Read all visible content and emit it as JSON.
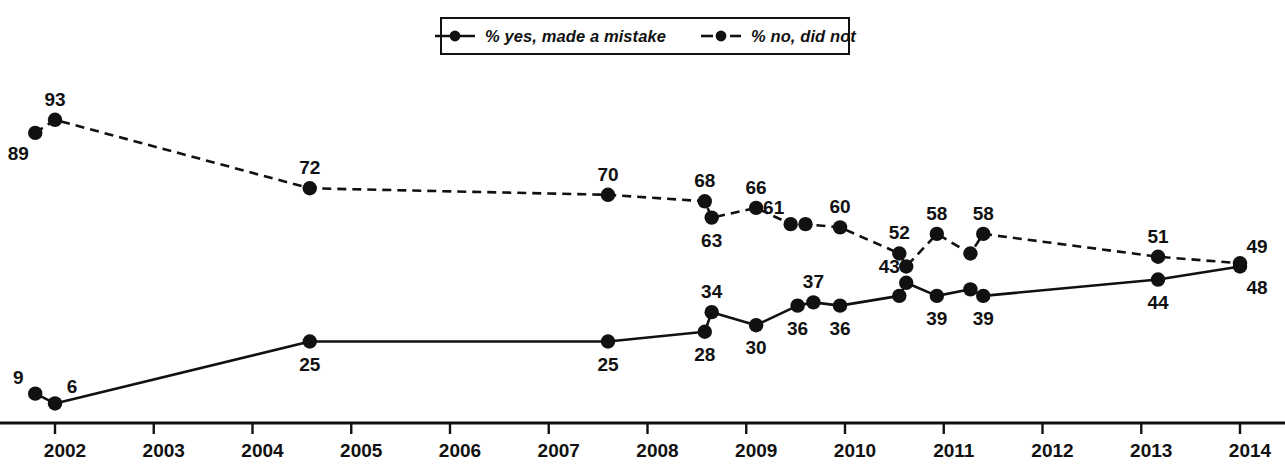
{
  "chart_data": {
    "type": "line",
    "title": "",
    "subtitle": "",
    "xlabel": "",
    "ylabel": "",
    "grid": false,
    "legend_position": "top-center",
    "xlim": [
      2001.6,
      2014.15
    ],
    "ylim": [
      0,
      100
    ],
    "x_tick_labels": [
      "2002",
      "2003",
      "2004",
      "2005",
      "2006",
      "2007",
      "2008",
      "2009",
      "2010",
      "2011",
      "2012",
      "2013",
      "2014"
    ],
    "x_ticks": [
      2002,
      2003,
      2004,
      2005,
      2006,
      2007,
      2008,
      2009,
      2010,
      2011,
      2012,
      2013,
      2014
    ],
    "series": [
      {
        "name": "% yes, made a mistake",
        "style": "solid",
        "marker": "circle",
        "color": "#111111",
        "points": [
          {
            "x": 2001.8,
            "y": 9,
            "label": "9",
            "label_pos": "above-left"
          },
          {
            "x": 2002.0,
            "y": 6,
            "label": "6",
            "label_pos": "above-right"
          },
          {
            "x": 2004.58,
            "y": 25,
            "label": "25",
            "label_pos": "below"
          },
          {
            "x": 2007.6,
            "y": 25,
            "label": "25",
            "label_pos": "below"
          },
          {
            "x": 2008.58,
            "y": 28,
            "label": "28",
            "label_pos": "below"
          },
          {
            "x": 2008.65,
            "y": 34,
            "label": "34",
            "label_pos": "above"
          },
          {
            "x": 2009.1,
            "y": 30,
            "label": "30",
            "label_pos": "below"
          },
          {
            "x": 2009.52,
            "y": 36,
            "label": "36",
            "label_pos": "below"
          },
          {
            "x": 2009.68,
            "y": 37,
            "label": "37",
            "label_pos": "above"
          },
          {
            "x": 2009.95,
            "y": 36,
            "label": "36",
            "label_pos": "below"
          },
          {
            "x": 2010.55,
            "y": 39,
            "label": "",
            "label_pos": "none"
          },
          {
            "x": 2010.62,
            "y": 43,
            "label": "43",
            "label_pos": "above-left"
          },
          {
            "x": 2010.93,
            "y": 39,
            "label": "39",
            "label_pos": "below"
          },
          {
            "x": 2011.27,
            "y": 41,
            "label": "",
            "label_pos": "none"
          },
          {
            "x": 2011.4,
            "y": 39,
            "label": "39",
            "label_pos": "below"
          },
          {
            "x": 2013.17,
            "y": 44,
            "label": "44",
            "label_pos": "below"
          },
          {
            "x": 2014.0,
            "y": 48,
            "label": "48",
            "label_pos": "below-right"
          }
        ]
      },
      {
        "name": "% no, did not",
        "style": "dashed",
        "marker": "circle",
        "color": "#111111",
        "points": [
          {
            "x": 2001.8,
            "y": 89,
            "label": "89",
            "label_pos": "below-left"
          },
          {
            "x": 2002.0,
            "y": 93,
            "label": "93",
            "label_pos": "above"
          },
          {
            "x": 2004.58,
            "y": 72,
            "label": "72",
            "label_pos": "above"
          },
          {
            "x": 2007.6,
            "y": 70,
            "label": "70",
            "label_pos": "above"
          },
          {
            "x": 2008.58,
            "y": 68,
            "label": "68",
            "label_pos": "above"
          },
          {
            "x": 2008.65,
            "y": 63,
            "label": "63",
            "label_pos": "below"
          },
          {
            "x": 2009.1,
            "y": 66,
            "label": "66",
            "label_pos": "above"
          },
          {
            "x": 2009.45,
            "y": 61,
            "label": "61",
            "label_pos": "above-left"
          },
          {
            "x": 2009.6,
            "y": 61,
            "label": "",
            "label_pos": "none"
          },
          {
            "x": 2009.95,
            "y": 60,
            "label": "60",
            "label_pos": "above"
          },
          {
            "x": 2010.55,
            "y": 52,
            "label": "52",
            "label_pos": "above"
          },
          {
            "x": 2010.62,
            "y": 48,
            "label": "",
            "label_pos": "none"
          },
          {
            "x": 2010.93,
            "y": 58,
            "label": "58",
            "label_pos": "above"
          },
          {
            "x": 2011.27,
            "y": 52,
            "label": "",
            "label_pos": "none"
          },
          {
            "x": 2011.4,
            "y": 58,
            "label": "58",
            "label_pos": "above"
          },
          {
            "x": 2013.17,
            "y": 51,
            "label": "51",
            "label_pos": "above"
          },
          {
            "x": 2014.0,
            "y": 49,
            "label": "49",
            "label_pos": "above-right"
          }
        ]
      }
    ]
  },
  "legend": {
    "entries": [
      {
        "label": "% yes, made a mistake",
        "style": "solid"
      },
      {
        "label": "% no, did not",
        "style": "dashed"
      }
    ]
  }
}
